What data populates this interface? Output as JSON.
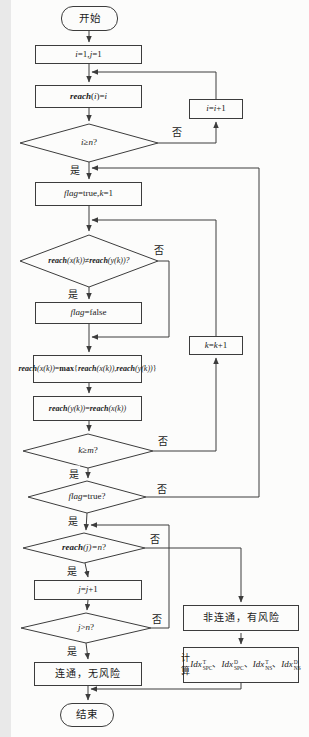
{
  "meta": {
    "background": "#fcfcfb",
    "line_color": "#3c3c3c",
    "text_color": "#1a1a1a"
  },
  "labels": {
    "yes": "是",
    "no": "否"
  },
  "nodes": {
    "start": {
      "segments": [
        {
          "t": "开始"
        }
      ]
    },
    "init": {
      "segments": [
        {
          "t": "i",
          "c": "i"
        },
        {
          "t": "=1, "
        },
        {
          "t": "j",
          "c": "i"
        },
        {
          "t": "=1"
        }
      ]
    },
    "reach_init": {
      "segments": [
        {
          "t": "reach",
          "c": "bi"
        },
        {
          "t": "("
        },
        {
          "t": "i",
          "c": "i"
        },
        {
          "t": ")="
        },
        {
          "t": "i",
          "c": "i"
        }
      ]
    },
    "i_inc": {
      "segments": [
        {
          "t": "i",
          "c": "i"
        },
        {
          "t": "="
        },
        {
          "t": "i",
          "c": "i"
        },
        {
          "t": "+1"
        }
      ]
    },
    "d_i_ge_n": {
      "segments": [
        {
          "t": "i",
          "c": "i"
        },
        {
          "t": "≥"
        },
        {
          "t": "n",
          "c": "i"
        },
        {
          "t": "?"
        }
      ]
    },
    "flag_init": {
      "segments": [
        {
          "t": "flag",
          "c": "i"
        },
        {
          "t": "=true, "
        },
        {
          "t": "k",
          "c": "i"
        },
        {
          "t": "=1"
        }
      ]
    },
    "d_reach_neq": {
      "segments": [
        {
          "t": "reach",
          "c": "bi"
        },
        {
          "t": "(x(k)) ",
          "c": "i"
        },
        {
          "t": "≠"
        },
        {
          "t": "reach",
          "c": "bi"
        },
        {
          "t": "(y(k))?",
          "c": "i"
        }
      ]
    },
    "flag_false": {
      "segments": [
        {
          "t": "flag",
          "c": "i"
        },
        {
          "t": "=false"
        }
      ]
    },
    "k_inc": {
      "segments": [
        {
          "t": "k",
          "c": "i"
        },
        {
          "t": "="
        },
        {
          "t": "k",
          "c": "i"
        },
        {
          "t": "+1"
        }
      ]
    },
    "reach_max": {
      "segments": [
        {
          "t": "reach",
          "c": "bi"
        },
        {
          "t": "(x(k))",
          "c": "i"
        },
        {
          "t": "="
        },
        {
          "t": "max",
          "c": "b"
        },
        {
          "br": true
        },
        {
          "t": "{"
        },
        {
          "t": "reach",
          "c": "bi"
        },
        {
          "t": "(x(k))",
          "c": "i"
        },
        {
          "t": ","
        },
        {
          "t": "reach",
          "c": "bi"
        },
        {
          "t": "(y(k))",
          "c": "i"
        },
        {
          "t": "}"
        }
      ]
    },
    "reach_assign": {
      "segments": [
        {
          "t": "reach",
          "c": "bi"
        },
        {
          "t": "(y(k))",
          "c": "i"
        },
        {
          "t": "="
        },
        {
          "t": "reach",
          "c": "bi"
        },
        {
          "t": "(x(k))",
          "c": "i"
        }
      ]
    },
    "d_k_ge_m": {
      "segments": [
        {
          "t": "k",
          "c": "i"
        },
        {
          "t": "≥"
        },
        {
          "t": "m",
          "c": "i"
        },
        {
          "t": "?"
        }
      ]
    },
    "d_flag_true": {
      "segments": [
        {
          "t": "flag",
          "c": "i"
        },
        {
          "t": "=true?"
        }
      ]
    },
    "d_reach_j_n": {
      "segments": [
        {
          "t": "reach",
          "c": "bi"
        },
        {
          "t": "(j)=",
          "c": "i"
        },
        {
          "t": "n",
          "c": "i"
        },
        {
          "t": "?"
        }
      ]
    },
    "j_inc": {
      "segments": [
        {
          "t": "j",
          "c": "i"
        },
        {
          "t": "="
        },
        {
          "t": "j",
          "c": "i"
        },
        {
          "t": "+1"
        }
      ]
    },
    "d_j_gt_n": {
      "segments": [
        {
          "t": "j",
          "c": "i"
        },
        {
          "t": ">"
        },
        {
          "t": "n",
          "c": "i"
        },
        {
          "t": "?"
        }
      ]
    },
    "connected": {
      "segments": [
        {
          "t": "连通，无风险"
        }
      ]
    },
    "not_connected": {
      "segments": [
        {
          "t": "非连通，有风险"
        }
      ]
    },
    "calc": {
      "segments": [
        {
          "t": "计算"
        },
        {
          "t": "Idx",
          "c": "i"
        },
        {
          "sup": "T",
          "sub": "SPC"
        },
        {
          "t": "、"
        },
        {
          "t": "Idx",
          "c": "i"
        },
        {
          "sup": "D",
          "sub": "SPC"
        },
        {
          "t": "、"
        },
        {
          "br": true
        },
        {
          "t": "Idx",
          "c": "i"
        },
        {
          "sup": "T",
          "sub": "NS"
        },
        {
          "t": "、"
        },
        {
          "t": "Idx",
          "c": "i"
        },
        {
          "sup": "D",
          "sub": "NS"
        }
      ]
    },
    "end": {
      "segments": [
        {
          "t": "结束"
        }
      ]
    }
  }
}
